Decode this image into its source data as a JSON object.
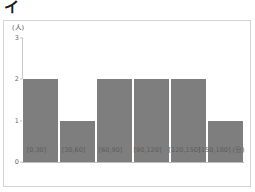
{
  "figure": {
    "marker": "イ"
  },
  "chart_data": {
    "type": "bar",
    "title": "",
    "subtitle": "",
    "xlabel": "",
    "ylabel": "",
    "y_unit": "(人)",
    "x_unit": "(分)",
    "categories": [
      "[0,30]",
      "[30,60]",
      "[60,90]",
      "[90,120]",
      "[120,150]",
      "[150,180]"
    ],
    "values": [
      2,
      1,
      2,
      2,
      2,
      1
    ],
    "yticks": [
      "0",
      "1",
      "2",
      "3"
    ],
    "ytick_values": [
      0,
      1,
      2,
      3
    ],
    "ylim": [
      0,
      3
    ],
    "grid": false,
    "legend": "none",
    "bar_color": "#7e7e7e",
    "frame_color": "#d4d4d4",
    "axis_color": "#c0c0c0",
    "tick_text_color": "#6a6a6a"
  }
}
